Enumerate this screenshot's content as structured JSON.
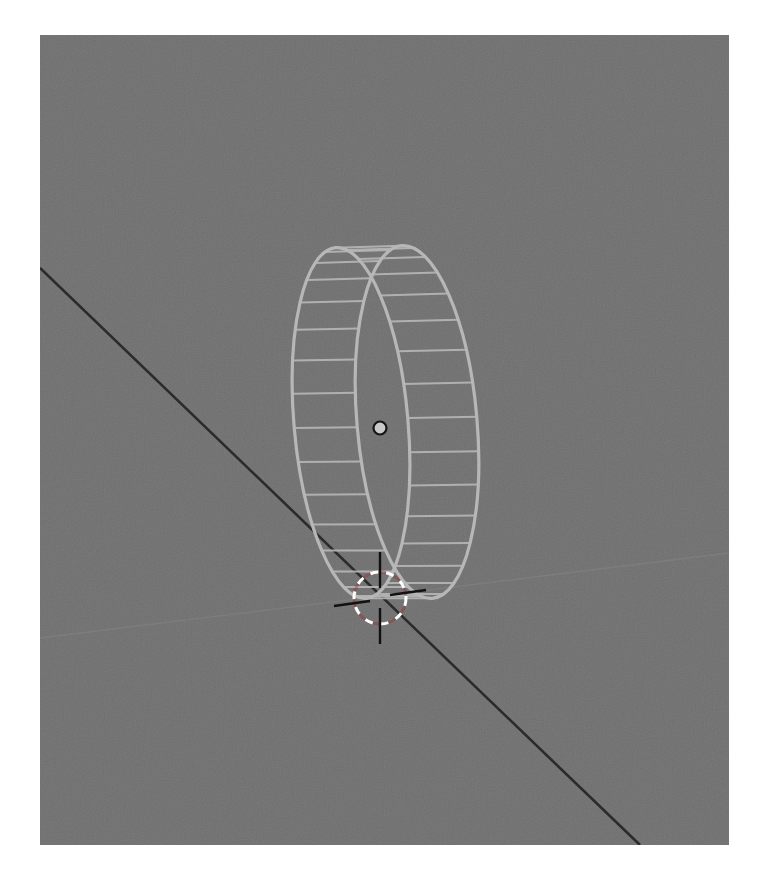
{
  "viewport": {
    "name": "3D Viewport",
    "background_color": "#6f6f6f",
    "x": 40,
    "y": 35,
    "width": 689,
    "height": 810
  },
  "scene": {
    "grid_lines": [
      {
        "name": "x-axis-line",
        "color": "#2b2b2b",
        "x1": 0,
        "y1": 233,
        "x2": 600,
        "y2": 810,
        "width": 2.6
      },
      {
        "name": "grid-floor-line",
        "color": "#7d7d7d",
        "x1": 0,
        "y1": 603,
        "x2": 689,
        "y2": 518,
        "width": 1.4
      }
    ],
    "object": {
      "type": "ring-wireframe",
      "color": "#b7b7b7",
      "rim_a": {
        "cx": 311,
        "cy": 388,
        "rx": 57,
        "ry": 176,
        "rotate": -5
      },
      "rim_b": {
        "cx": 377,
        "cy": 387,
        "rx": 60,
        "ry": 177,
        "rotate": -5
      },
      "segments": 32
    },
    "origin_point": {
      "x": 340,
      "y": 393,
      "r": 6.5,
      "fill": "#c9c9c9",
      "stroke": "#151515"
    },
    "cursor_3d": {
      "x": 340,
      "y": 563,
      "r": 26,
      "arm": 46
    }
  }
}
